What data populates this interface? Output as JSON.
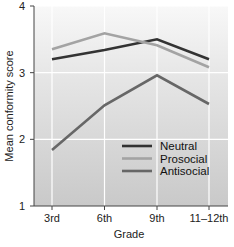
{
  "chart_data": {
    "type": "line",
    "title": "",
    "xlabel": "Grade",
    "ylabel": "Mean conformity score",
    "categories": [
      "3rd",
      "6th",
      "9th",
      "11–12th"
    ],
    "ylim": [
      1,
      4
    ],
    "yticks": [
      1,
      2,
      3,
      4
    ],
    "grid": true,
    "legend_position": "lower right (inside plot)",
    "series": [
      {
        "name": "Neutral",
        "color": "#333333",
        "values": [
          3.2,
          3.34,
          3.5,
          3.2
        ]
      },
      {
        "name": "Prosocial",
        "color": "#a3a3a3",
        "values": [
          3.35,
          3.59,
          3.41,
          3.08
        ]
      },
      {
        "name": "Antisocial",
        "color": "#676767",
        "values": [
          1.84,
          2.51,
          2.96,
          2.53
        ]
      }
    ]
  },
  "colors": {
    "plot_bg_top": "#f8f8f8",
    "plot_bg_bottom": "#c9c9c9",
    "grid": "#ffffff",
    "axis": "#444444"
  }
}
